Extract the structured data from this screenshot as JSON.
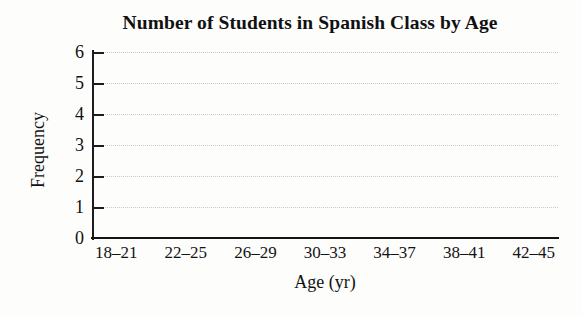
{
  "chart_data": {
    "type": "bar",
    "title": "Number of Students in Spanish Class by Age",
    "xlabel": "Age (yr)",
    "ylabel": "Frequency",
    "categories": [
      "18–21",
      "22–25",
      "26–29",
      "30–33",
      "34–37",
      "38–41",
      "42–45"
    ],
    "values": [
      0,
      0,
      0,
      0,
      0,
      0,
      0
    ],
    "ylim": [
      0,
      6
    ],
    "ytick_labels": [
      "6",
      "5",
      "4",
      "3",
      "2",
      "1",
      "0"
    ],
    "ytick_values": [
      6,
      5,
      4,
      3,
      2,
      1,
      0
    ],
    "grid": "horizontal-dotted",
    "legend": "none",
    "note": "blank histogram template — no bars drawn",
    "colors": {
      "axis": "#1c1c1c",
      "gridline": "#c9c9c9",
      "text": "#111111",
      "background": "#fdfdfc"
    }
  }
}
